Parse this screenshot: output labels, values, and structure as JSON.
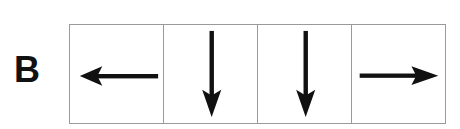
{
  "panel": {
    "label": "B",
    "cells": [
      {
        "direction": "left",
        "icon": "arrow-left-icon"
      },
      {
        "direction": "down",
        "icon": "arrow-down-icon"
      },
      {
        "direction": "down",
        "icon": "arrow-down-icon"
      },
      {
        "direction": "right",
        "icon": "arrow-right-icon"
      }
    ],
    "colors": {
      "arrow": "#111111",
      "border": "#9a9a9a",
      "background": "#ffffff"
    }
  }
}
